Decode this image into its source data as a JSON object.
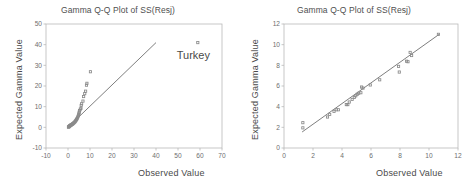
{
  "figure": {
    "background_color": "#ffffff",
    "frame_color": "#b9b9b9",
    "point_color": "#8a8a8a",
    "line_color": "#6f6f6f",
    "text_color": "#4f4f4f"
  },
  "chart_data": [
    {
      "id": "left",
      "type": "scatter",
      "title": "Gamma Q-Q Plot of SS(Resj)",
      "xlabel": "Observed Value",
      "ylabel": "Expected Gamma Value",
      "xlim": [
        -10,
        70
      ],
      "ylim": [
        -10,
        50
      ],
      "xticks": [
        -10,
        0,
        10,
        20,
        30,
        40,
        50,
        60,
        70
      ],
      "xtick_labels": [
        "-10",
        "0",
        "10",
        "20",
        "30",
        "40",
        "50",
        "60",
        "70"
      ],
      "yticks": [
        -10,
        0,
        10,
        20,
        30,
        40,
        50
      ],
      "ytick_labels": [
        "-10",
        "0",
        "10",
        "20",
        "30",
        "40",
        "50"
      ],
      "grid": false,
      "legend": "none",
      "reference_line": {
        "x": [
          0.2,
          40.0
        ],
        "y": [
          0.2,
          41.0
        ]
      },
      "annotations": [
        {
          "text": "Turkey",
          "x": 57.0,
          "y": 33.0
        }
      ],
      "points": [
        {
          "x": 0.2,
          "y": 0.1
        },
        {
          "x": 0.3,
          "y": 0.2
        },
        {
          "x": 0.4,
          "y": 0.3
        },
        {
          "x": 0.5,
          "y": 0.4
        },
        {
          "x": 0.6,
          "y": 0.5
        },
        {
          "x": 0.7,
          "y": 0.6
        },
        {
          "x": 0.8,
          "y": 0.7
        },
        {
          "x": 0.9,
          "y": 0.8
        },
        {
          "x": 1.0,
          "y": 0.9
        },
        {
          "x": 1.2,
          "y": 1.0
        },
        {
          "x": 1.3,
          "y": 1.1
        },
        {
          "x": 1.5,
          "y": 1.2
        },
        {
          "x": 1.6,
          "y": 1.3
        },
        {
          "x": 1.8,
          "y": 1.4
        },
        {
          "x": 2.0,
          "y": 1.5
        },
        {
          "x": 2.1,
          "y": 1.7
        },
        {
          "x": 2.3,
          "y": 1.8
        },
        {
          "x": 2.5,
          "y": 2.0
        },
        {
          "x": 2.7,
          "y": 2.2
        },
        {
          "x": 2.9,
          "y": 2.4
        },
        {
          "x": 3.1,
          "y": 2.6
        },
        {
          "x": 3.3,
          "y": 2.9
        },
        {
          "x": 3.5,
          "y": 3.2
        },
        {
          "x": 3.7,
          "y": 3.5
        },
        {
          "x": 3.9,
          "y": 3.8
        },
        {
          "x": 4.1,
          "y": 4.2
        },
        {
          "x": 4.3,
          "y": 4.6
        },
        {
          "x": 4.5,
          "y": 5.1
        },
        {
          "x": 4.7,
          "y": 5.6
        },
        {
          "x": 4.9,
          "y": 6.2
        },
        {
          "x": 5.0,
          "y": 6.8
        },
        {
          "x": 5.1,
          "y": 7.4
        },
        {
          "x": 5.3,
          "y": 8.1
        },
        {
          "x": 5.6,
          "y": 8.8
        },
        {
          "x": 5.9,
          "y": 9.2
        },
        {
          "x": 6.0,
          "y": 10.6
        },
        {
          "x": 6.2,
          "y": 11.4
        },
        {
          "x": 6.8,
          "y": 12.7
        },
        {
          "x": 7.1,
          "y": 14.9
        },
        {
          "x": 7.6,
          "y": 16.3
        },
        {
          "x": 8.0,
          "y": 17.5
        },
        {
          "x": 8.4,
          "y": 20.4
        },
        {
          "x": 8.6,
          "y": 21.3
        },
        {
          "x": 10.2,
          "y": 26.9
        },
        {
          "x": 59.0,
          "y": 41.0
        }
      ]
    },
    {
      "id": "right",
      "type": "scatter",
      "title": "Gamma Q-Q Plot of SS(Resj)",
      "xlabel": "Observed Value",
      "ylabel": "Expected Gamma Value",
      "xlim": [
        0,
        12
      ],
      "ylim": [
        0,
        12
      ],
      "xticks": [
        0,
        2,
        4,
        6,
        8,
        10,
        12
      ],
      "xtick_labels": [
        "0",
        "2",
        "4",
        "6",
        "8",
        "10",
        "12"
      ],
      "yticks": [
        0,
        2,
        4,
        6,
        8,
        10,
        12
      ],
      "ytick_labels": [
        "0",
        "2",
        "4",
        "6",
        "8",
        "10",
        "12"
      ],
      "grid": false,
      "legend": "none",
      "reference_line": {
        "x": [
          1.25,
          10.7
        ],
        "y": [
          1.55,
          11.0
        ]
      },
      "annotations": [],
      "points": [
        {
          "x": 1.3,
          "y": 2.45
        },
        {
          "x": 1.3,
          "y": 1.95
        },
        {
          "x": 3.0,
          "y": 3.0
        },
        {
          "x": 3.15,
          "y": 3.25
        },
        {
          "x": 3.45,
          "y": 3.55
        },
        {
          "x": 3.6,
          "y": 3.7
        },
        {
          "x": 3.75,
          "y": 3.7
        },
        {
          "x": 4.3,
          "y": 4.2
        },
        {
          "x": 4.4,
          "y": 4.2
        },
        {
          "x": 4.5,
          "y": 4.45
        },
        {
          "x": 4.7,
          "y": 4.7
        },
        {
          "x": 4.85,
          "y": 4.9
        },
        {
          "x": 4.95,
          "y": 5.05
        },
        {
          "x": 5.05,
          "y": 5.2
        },
        {
          "x": 5.15,
          "y": 5.3
        },
        {
          "x": 5.3,
          "y": 5.35
        },
        {
          "x": 5.35,
          "y": 5.9
        },
        {
          "x": 5.45,
          "y": 5.8
        },
        {
          "x": 5.95,
          "y": 6.1
        },
        {
          "x": 6.6,
          "y": 6.6
        },
        {
          "x": 7.9,
          "y": 7.9
        },
        {
          "x": 7.95,
          "y": 7.35
        },
        {
          "x": 8.45,
          "y": 8.4
        },
        {
          "x": 8.55,
          "y": 8.35
        },
        {
          "x": 8.7,
          "y": 9.25
        },
        {
          "x": 8.8,
          "y": 8.95
        },
        {
          "x": 10.65,
          "y": 11.0
        }
      ]
    }
  ]
}
